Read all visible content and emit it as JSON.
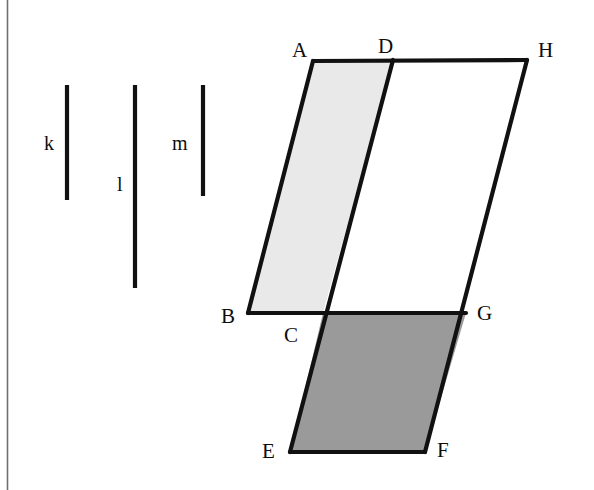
{
  "page": {
    "width": 594,
    "height": 490,
    "background_color": "#ffffff",
    "left_border_color": "#6e6e6e"
  },
  "diagram": {
    "type": "geometry-figure",
    "stroke_color": "#111111",
    "stroke_width": 4,
    "reference_segments": [
      {
        "id": "k",
        "label": "k",
        "x": 67,
        "y1": 85,
        "y2": 200,
        "length": 115,
        "label_x": 44,
        "label_y": 133
      },
      {
        "id": "l",
        "label": "l",
        "x": 135,
        "y1": 85,
        "y2": 288,
        "length": 203,
        "label_x": 115,
        "label_y": 174
      },
      {
        "id": "m",
        "label": "m",
        "x": 203,
        "y1": 85,
        "y2": 196,
        "length": 111,
        "label_x": 172,
        "label_y": 133
      }
    ],
    "vertices": [
      {
        "name": "A",
        "x": 313,
        "y": 61,
        "label_x": 292,
        "label_y": 40
      },
      {
        "name": "D",
        "x": 393,
        "y": 60,
        "label_x": 378,
        "label_y": 38
      },
      {
        "name": "H",
        "x": 527,
        "y": 60,
        "label_x": 538,
        "label_y": 40
      },
      {
        "name": "B",
        "x": 248,
        "y": 313,
        "label_x": 222,
        "label_y": 306
      },
      {
        "name": "C",
        "x": 323,
        "y": 313,
        "label_x": 285,
        "label_y": 325
      },
      {
        "name": "G",
        "x": 466,
        "y": 313,
        "label_x": 477,
        "label_y": 303
      },
      {
        "name": "E",
        "x": 290,
        "y": 452,
        "label_x": 262,
        "label_y": 442
      },
      {
        "name": "F",
        "x": 425,
        "y": 452,
        "label_x": 437,
        "label_y": 440
      }
    ],
    "regions": [
      {
        "id": "ABCD",
        "name": "upper-left-parallelogram",
        "vertices": [
          "A",
          "D",
          "C",
          "B"
        ],
        "points": "313,61 393,60 323,313 248,313",
        "fill": "#e9e9e9",
        "shading": "light-gray"
      },
      {
        "id": "DHGC",
        "name": "upper-right-parallelogram",
        "vertices": [
          "D",
          "H",
          "G",
          "C"
        ],
        "points": "393,60 527,60 466,313 323,313",
        "fill": "#ffffff",
        "shading": "unshaded"
      },
      {
        "id": "CGFE",
        "name": "lower-parallelogram",
        "vertices": [
          "C",
          "G",
          "F",
          "E"
        ],
        "points": "323,313 466,313 425,452 290,452",
        "fill": "#9a9a9a",
        "shading": "dark-gray"
      }
    ],
    "edges": [
      {
        "id": "AH",
        "from": "A",
        "to": "H",
        "x1": 313,
        "y1": 61,
        "x2": 527,
        "y2": 60
      },
      {
        "id": "BG",
        "from": "B",
        "to": "G",
        "x1": 248,
        "y1": 313,
        "x2": 466,
        "y2": 313
      },
      {
        "id": "EF",
        "from": "E",
        "to": "F",
        "x1": 290,
        "y1": 452,
        "x2": 425,
        "y2": 452
      },
      {
        "id": "AB",
        "from": "A",
        "to": "B",
        "x1": 313,
        "y1": 61,
        "x2": 248,
        "y2": 313
      },
      {
        "id": "DE",
        "from": "D",
        "to": "E",
        "x1": 393,
        "y1": 60,
        "x2": 290,
        "y2": 452
      },
      {
        "id": "HF",
        "from": "H",
        "to": "F",
        "x1": 527,
        "y1": 60,
        "x2": 425,
        "y2": 452
      }
    ]
  }
}
